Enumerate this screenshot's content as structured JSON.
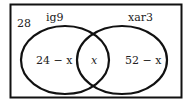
{
  "diagram": {
    "type": "venn",
    "universal_label": "28",
    "sets": [
      {
        "name": "ig9",
        "only_region": "24 − x"
      },
      {
        "name": "xar3",
        "only_region": "52 − x"
      }
    ],
    "intersection": "x",
    "stroke_color": "#111111"
  }
}
